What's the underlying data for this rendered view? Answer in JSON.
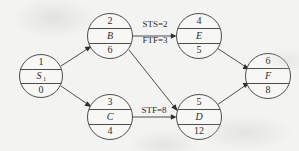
{
  "diagram": {
    "kind": "activity-on-node-precedence-network",
    "background_color": "#f3f3f1",
    "stroke_color": "#3a3a3a",
    "nodes": [
      {
        "id": "s1",
        "number": "1",
        "name": "S",
        "subscript": "1",
        "duration": "0",
        "cx": 41,
        "cy": 76
      },
      {
        "id": "b",
        "number": "2",
        "name": "B",
        "subscript": "",
        "duration": "6",
        "cx": 110,
        "cy": 36
      },
      {
        "id": "c",
        "number": "3",
        "name": "C",
        "subscript": "",
        "duration": "4",
        "cx": 110,
        "cy": 117
      },
      {
        "id": "e",
        "number": "4",
        "name": "E",
        "subscript": "",
        "duration": "5",
        "cx": 199,
        "cy": 36
      },
      {
        "id": "d",
        "number": "5",
        "name": "D",
        "subscript": "",
        "duration": "12",
        "cx": 199,
        "cy": 117
      },
      {
        "id": "f",
        "number": "6",
        "name": "F",
        "subscript": "",
        "duration": "8",
        "cx": 268,
        "cy": 76
      }
    ],
    "edges": [
      {
        "id": "s1-b",
        "from": "s1",
        "to": "b",
        "label": ""
      },
      {
        "id": "s1-c",
        "from": "s1",
        "to": "c",
        "label": ""
      },
      {
        "id": "b-e",
        "from": "b",
        "to": "e",
        "label": "STS=2"
      },
      {
        "id": "b-e2",
        "from": "b",
        "to": "e",
        "label": "FTF=3"
      },
      {
        "id": "b-d",
        "from": "b",
        "to": "d",
        "label": ""
      },
      {
        "id": "c-d",
        "from": "c",
        "to": "d",
        "label": "STF=8"
      },
      {
        "id": "e-f",
        "from": "e",
        "to": "f",
        "label": ""
      },
      {
        "id": "d-f",
        "from": "d",
        "to": "f",
        "label": ""
      }
    ],
    "edge_labels": {
      "sts": "STS=2",
      "ftf": "FTF=3",
      "stf": "STF=8"
    }
  }
}
